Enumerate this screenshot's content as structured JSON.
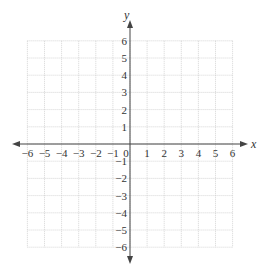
{
  "chart_data": {
    "type": "scatter",
    "title": "",
    "xlabel": "x",
    "ylabel": "y",
    "xlim": [
      -6,
      6
    ],
    "ylim": [
      -6,
      6
    ],
    "grid": true,
    "grid_style": "dotted",
    "x_ticks": [
      "-6",
      "-5",
      "-4",
      "-3",
      "-2",
      "-1",
      "0",
      "1",
      "2",
      "3",
      "4",
      "5",
      "6"
    ],
    "y_ticks": [
      "6",
      "5",
      "4",
      "3",
      "2",
      "1",
      "-1",
      "-2",
      "-3",
      "-4",
      "-5",
      "-6"
    ],
    "series": [],
    "colors": {
      "axis": "#444444",
      "grid": "#cccccc",
      "text": "#333333"
    }
  }
}
